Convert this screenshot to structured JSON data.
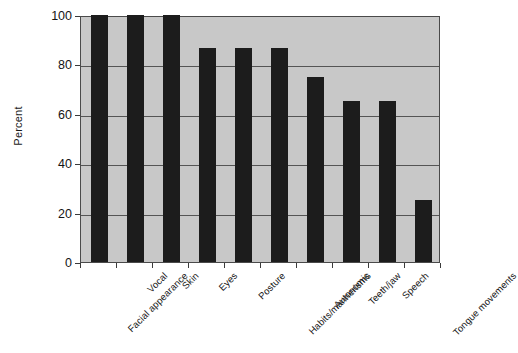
{
  "chart_data": {
    "type": "bar",
    "title": "",
    "subtitle": "",
    "xlabel": "",
    "ylabel": "Percent",
    "ylim": [
      0,
      100
    ],
    "yticks": [
      0,
      20,
      40,
      60,
      80,
      100
    ],
    "ytick_labels": [
      "0",
      "20",
      "40",
      "60",
      "80",
      "100"
    ],
    "grid": true,
    "legend": false,
    "legend_position": "none",
    "bar_color": "#1c1c1c",
    "plot_background": "#c8c8c8",
    "figure_background": "#ffffff",
    "axis_color": "#4a4a4a",
    "gridline_color": "#555555",
    "categories": [
      "Facial appearance",
      "Vocal",
      "Skin",
      "Eyes",
      "Posture",
      "Habits/mannerisms",
      "Autonomic",
      "Teeth/jaw",
      "Speech",
      "Tongue movements"
    ],
    "values": [
      100,
      100,
      100,
      86.5,
      86.5,
      86.5,
      75,
      65,
      65,
      25
    ],
    "value_unit": "percent"
  }
}
